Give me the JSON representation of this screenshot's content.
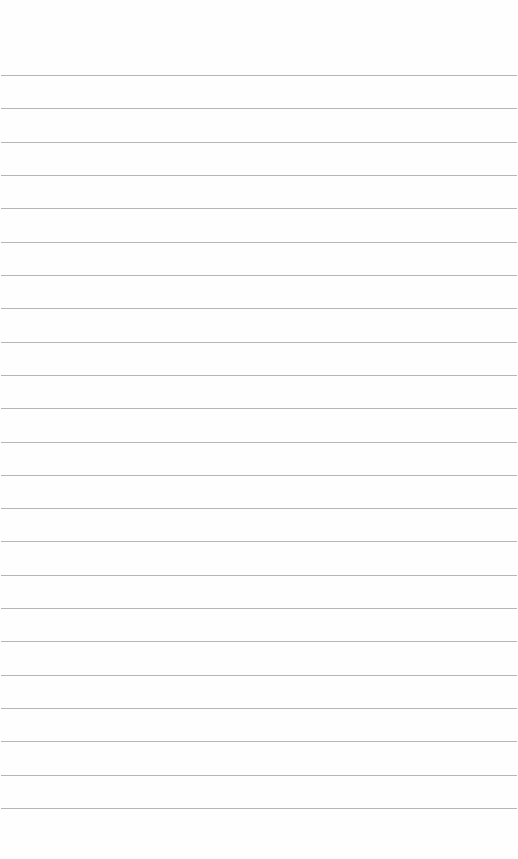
{
  "page": {
    "type": "lined-paper",
    "background_color": "#fefefe",
    "line_color": "#a9a9a9",
    "line_count": 23,
    "first_line_y": 75,
    "line_spacing": 33.32
  }
}
